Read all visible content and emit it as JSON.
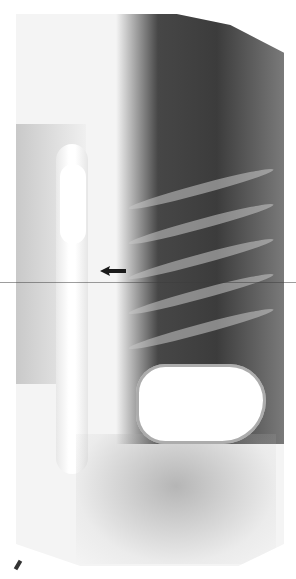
{
  "image": {
    "type": "radiograph",
    "view": "barium swallow, chest/upper abdomen",
    "annotations": [
      {
        "kind": "arrow",
        "direction": "left",
        "color": "#1a1a1a"
      }
    ]
  },
  "colors": {
    "background": "#ffffff",
    "dark_region": "#333333",
    "contrast_bright": "#ffffff"
  }
}
